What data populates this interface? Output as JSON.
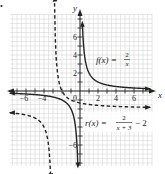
{
  "figure": {
    "marker": "•"
  },
  "chart_data": {
    "type": "line",
    "title": "",
    "xlabel": "x",
    "ylabel": "y",
    "xlim": [
      -8,
      8
    ],
    "ylim": [
      -8,
      8
    ],
    "grid": true,
    "x_ticks": [
      -6,
      -4,
      2,
      4,
      6
    ],
    "y_ticks": [
      6,
      4,
      2,
      -6
    ],
    "origin_label": "0",
    "series": [
      {
        "name": "f(x) = 2/x",
        "label_lhs": "f(x) =",
        "label_num": "2",
        "label_den": "x",
        "style": "solid",
        "vertical_asymptote": 0,
        "horizontal_asymptote": 0,
        "points": [
          [
            -8,
            -0.25
          ],
          [
            -6,
            -0.333
          ],
          [
            -4,
            -0.5
          ],
          [
            -3,
            -0.667
          ],
          [
            -2,
            -1
          ],
          [
            -1,
            -2
          ],
          [
            -0.5,
            -4
          ],
          [
            -0.3,
            -6.67
          ],
          [
            0.28,
            7.14
          ],
          [
            0.5,
            4
          ],
          [
            1,
            2
          ],
          [
            2,
            1
          ],
          [
            3,
            0.667
          ],
          [
            4,
            0.5
          ],
          [
            6,
            0.333
          ],
          [
            8,
            0.25
          ]
        ]
      },
      {
        "name": "r(x) = 2/(x+3) - 2",
        "label_lhs": "r(x) =",
        "label_num": "2",
        "label_den": "x + 3",
        "label_rhs": "− 2",
        "style": "dashed",
        "vertical_asymptote": -3,
        "horizontal_asymptote": -2,
        "points": [
          [
            -8,
            -2.4
          ],
          [
            -6,
            -2.667
          ],
          [
            -5,
            -3
          ],
          [
            -4,
            -4
          ],
          [
            -3.5,
            -6
          ],
          [
            -3.3,
            -8.67
          ],
          [
            -2.8,
            8
          ],
          [
            -2.5,
            2
          ],
          [
            -2,
            0
          ],
          [
            -1,
            -1
          ],
          [
            0,
            -1.333
          ],
          [
            2,
            -1.6
          ],
          [
            4,
            -1.714
          ],
          [
            6,
            -1.778
          ],
          [
            8,
            -1.818
          ]
        ]
      }
    ],
    "annotations": [
      "f(x) = 2/x",
      "r(x) = 2/(x + 3) − 2"
    ]
  }
}
